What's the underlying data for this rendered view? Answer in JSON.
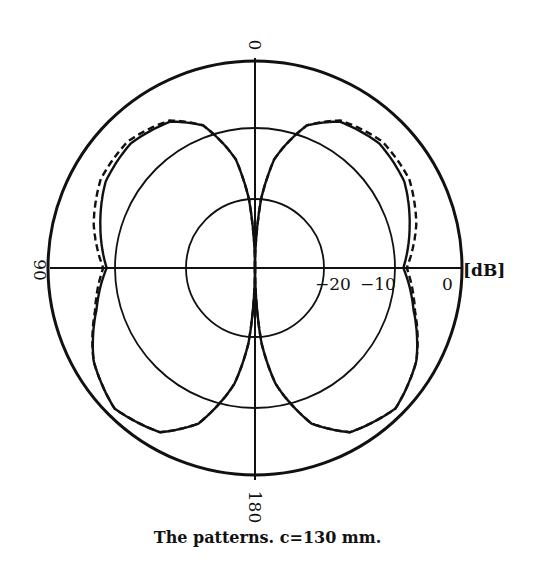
{
  "chart_data": {
    "type": "polar-line",
    "title": "",
    "caption": "The patterns. c=130 mm.",
    "radial_unit": "[dB]",
    "radial_range": [
      -30,
      0
    ],
    "radial_ticks": [
      {
        "value": -20,
        "label": "−20"
      },
      {
        "value": -10,
        "label": "−10"
      },
      {
        "value": 0,
        "label": "0"
      }
    ],
    "angle_labels": [
      {
        "angle": 0,
        "label": "0"
      },
      {
        "angle": 90,
        "label": "90"
      },
      {
        "angle": 180,
        "label": "180"
      }
    ],
    "grid_circles_db": [
      -20,
      -10,
      0
    ],
    "symmetric_about_vertical_axis": true,
    "angles_deg": [
      0,
      5,
      10,
      20,
      30,
      45,
      60,
      75,
      90,
      105,
      120,
      135,
      150,
      160,
      170,
      175,
      180
    ],
    "series": [
      {
        "name": "solid",
        "style": "solid",
        "values": [
          -30,
          -20,
          -14,
          -8,
          -5.5,
          -4.5,
          -5,
          -6.8,
          -8.5,
          -6.2,
          -3,
          -1.2,
          -2.5,
          -6,
          -13,
          -19,
          -30
        ]
      },
      {
        "name": "dashed",
        "style": "dashed",
        "values": [
          -30,
          -20,
          -14,
          -8,
          -5.3,
          -4,
          -4.2,
          -5.8,
          -8,
          -6,
          -3,
          -1.2,
          -2.5,
          -6,
          -13,
          -19,
          -30
        ]
      }
    ]
  },
  "labels": {
    "unit": "[dB]",
    "tick_m20": "−20",
    "tick_m10": "−10",
    "tick_0": "0",
    "angle_0": "0",
    "angle_90": "90",
    "angle_180": "180"
  },
  "caption": "The patterns. c=130 mm."
}
